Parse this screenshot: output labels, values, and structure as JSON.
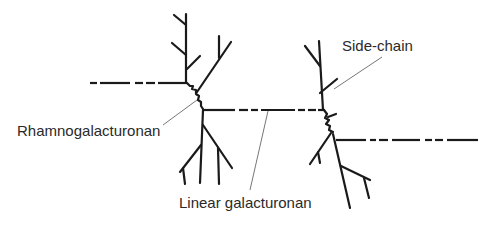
{
  "diagram": {
    "labels": {
      "rhamnogalacturonan": "Rhamnogalacturonan",
      "linear_galacturonan": "Linear galacturonan",
      "side_chain": "Side-chain"
    },
    "colors": {
      "line": "#1a1a1a",
      "leader": "#666666",
      "text": "#2a2a2a",
      "background": "#ffffff"
    }
  }
}
